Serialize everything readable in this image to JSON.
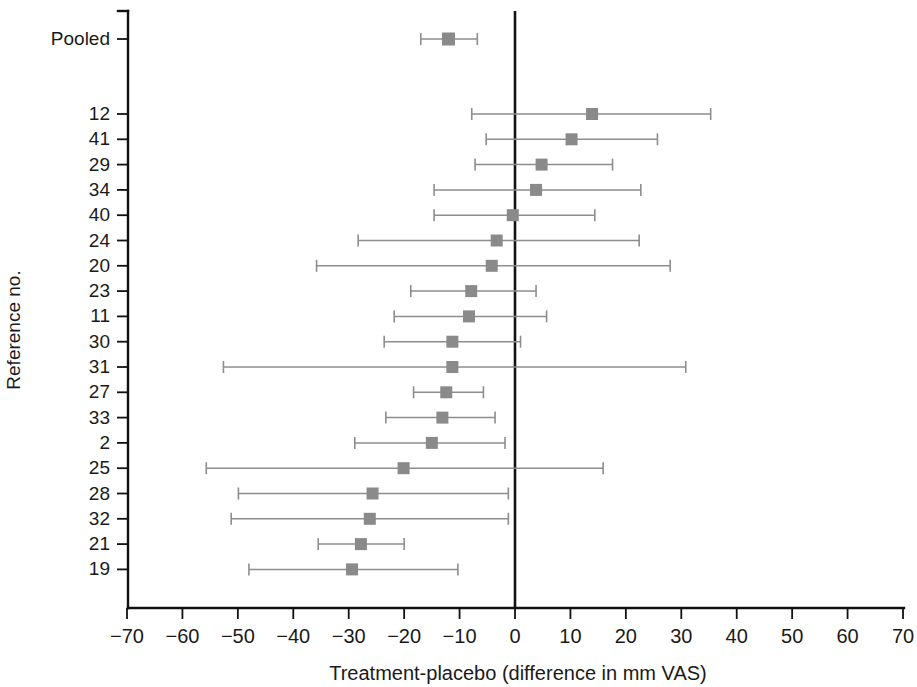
{
  "chart_data": {
    "type": "forest",
    "title": "",
    "xlabel": "Treatment-placebo (difference in mm VAS)",
    "ylabel": "Reference no.",
    "xlim": [
      -70,
      70
    ],
    "xticks": [
      -70,
      -60,
      -50,
      -40,
      -30,
      -20,
      -10,
      0,
      10,
      20,
      30,
      40,
      50,
      60,
      70
    ],
    "xtick_labels": [
      "−70",
      "−60",
      "−50",
      "−40",
      "−30",
      "−20",
      "−10",
      "0",
      "10",
      "20",
      "30",
      "40",
      "50",
      "60",
      "70"
    ],
    "grid": false,
    "legend": "none",
    "reference_line": 0,
    "marker_color": "#8a8a8a",
    "line_color": "#8d8d8d",
    "axis_color": "#111111",
    "summary_label": "Pooled",
    "rows": [
      {
        "label": "Pooled",
        "estimate": -12.0,
        "low": -17.0,
        "high": -6.8,
        "summary": true
      },
      {
        "label": "12",
        "estimate": 13.9,
        "low": -7.8,
        "high": 35.3,
        "summary": false
      },
      {
        "label": "41",
        "estimate": 10.2,
        "low": -5.2,
        "high": 25.7,
        "summary": false
      },
      {
        "label": "29",
        "estimate": 4.8,
        "low": -7.2,
        "high": 17.6,
        "summary": false
      },
      {
        "label": "34",
        "estimate": 3.8,
        "low": -14.6,
        "high": 22.7,
        "summary": false
      },
      {
        "label": "40",
        "estimate": -0.4,
        "low": -14.6,
        "high": 14.4,
        "summary": false
      },
      {
        "label": "24",
        "estimate": -3.3,
        "low": -28.3,
        "high": 22.4,
        "summary": false
      },
      {
        "label": "20",
        "estimate": -4.2,
        "low": -35.8,
        "high": 28.0,
        "summary": false
      },
      {
        "label": "23",
        "estimate": -7.9,
        "low": -18.8,
        "high": 3.8,
        "summary": false
      },
      {
        "label": "11",
        "estimate": -8.3,
        "low": -21.8,
        "high": 5.7,
        "summary": false
      },
      {
        "label": "30",
        "estimate": -11.3,
        "low": -23.6,
        "high": 1.0,
        "summary": false
      },
      {
        "label": "31",
        "estimate": -11.3,
        "low": -52.6,
        "high": 30.8,
        "summary": false
      },
      {
        "label": "27",
        "estimate": -12.4,
        "low": -18.3,
        "high": -5.7,
        "summary": false
      },
      {
        "label": "33",
        "estimate": -13.1,
        "low": -23.3,
        "high": -3.6,
        "summary": false
      },
      {
        "label": "2",
        "estimate": -15.0,
        "low": -28.9,
        "high": -1.8,
        "summary": false
      },
      {
        "label": "25",
        "estimate": -20.1,
        "low": -55.7,
        "high": 15.9,
        "summary": false
      },
      {
        "label": "28",
        "estimate": -25.7,
        "low": -49.9,
        "high": -1.2,
        "summary": false
      },
      {
        "label": "32",
        "estimate": -26.2,
        "low": -51.2,
        "high": -1.2,
        "summary": false
      },
      {
        "label": "21",
        "estimate": -27.8,
        "low": -35.5,
        "high": -20.0,
        "summary": false
      },
      {
        "label": "19",
        "estimate": -29.4,
        "low": -48.0,
        "high": -10.3,
        "summary": false
      }
    ]
  }
}
